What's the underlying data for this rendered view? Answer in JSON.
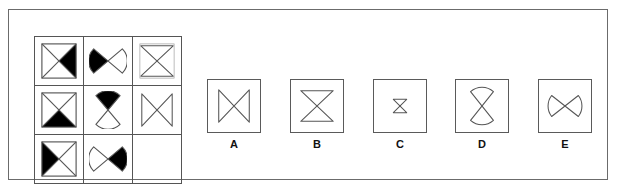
{
  "puzzle": {
    "kind": "matrix-reasoning-item",
    "title": "3x3 visual analogy matrix with five answer options",
    "stroke_color": "#555555",
    "fill_color": "#000000",
    "frame_color": "#6b6b6b",
    "background_color": "#ffffff"
  },
  "matrix": {
    "rows": 3,
    "columns": 3,
    "cells": [
      {
        "position": "row1-col1",
        "outline": "square",
        "figure": "bowtie-pair-x",
        "shaded_wedge": "right",
        "description": "Square containing both diagonals; right triangle filled black"
      },
      {
        "position": "row1-col2",
        "outline": "circle",
        "figure": "bowtie-horizontal",
        "shaded_wedge": "left",
        "description": "Circle with horizontal bowtie; left wedge filled black"
      },
      {
        "position": "row1-col3",
        "outline": "square",
        "figure": "hourglass-vertical",
        "shaded_wedge": "none",
        "description": "Square containing vertical hourglass outline, unshaded"
      },
      {
        "position": "row2-col1",
        "outline": "square",
        "figure": "bowtie-pair-x",
        "shaded_wedge": "bottom",
        "description": "Square containing both diagonals; bottom triangle filled black"
      },
      {
        "position": "row2-col2",
        "outline": "circle",
        "figure": "bowtie-vertical",
        "shaded_wedge": "top",
        "description": "Circle with vertical hourglass; top wedge filled black"
      },
      {
        "position": "row2-col3",
        "outline": "square",
        "figure": "bowtie-horizontal",
        "shaded_wedge": "none",
        "description": "Square containing horizontal bowtie outline, unshaded"
      },
      {
        "position": "row3-col1",
        "outline": "square",
        "figure": "bowtie-pair-x",
        "shaded_wedge": "left",
        "description": "Square containing both diagonals; left triangle filled black"
      },
      {
        "position": "row3-col2",
        "outline": "circle",
        "figure": "bowtie-horizontal",
        "shaded_wedge": "bottom-right",
        "description": "Circle with horizontal bowtie; right-lower wedge filled black"
      },
      {
        "position": "row3-col3",
        "outline": "none",
        "figure": "empty",
        "shaded_wedge": "none",
        "description": "Blank cell - the missing element to be solved"
      }
    ]
  },
  "options": [
    {
      "label": "A",
      "figure": "bowtie-horizontal",
      "description": "Square with horizontal bowtie (X plus left and right vertical edges)"
    },
    {
      "label": "B",
      "figure": "hourglass-vertical",
      "description": "Square with vertical hourglass (X plus top and bottom horizontal edges)"
    },
    {
      "label": "C",
      "figure": "hourglass-vertical-small",
      "description": "Square with a small vertical hourglass centred in the box"
    },
    {
      "label": "D",
      "figure": "hourglass-vertical-curved",
      "description": "Square with a vertical hourglass whose top and bottom edges are arcs"
    },
    {
      "label": "E",
      "figure": "bowtie-horizontal-curved",
      "description": "Square with a horizontal bowtie whose left and right edges are arcs"
    }
  ]
}
